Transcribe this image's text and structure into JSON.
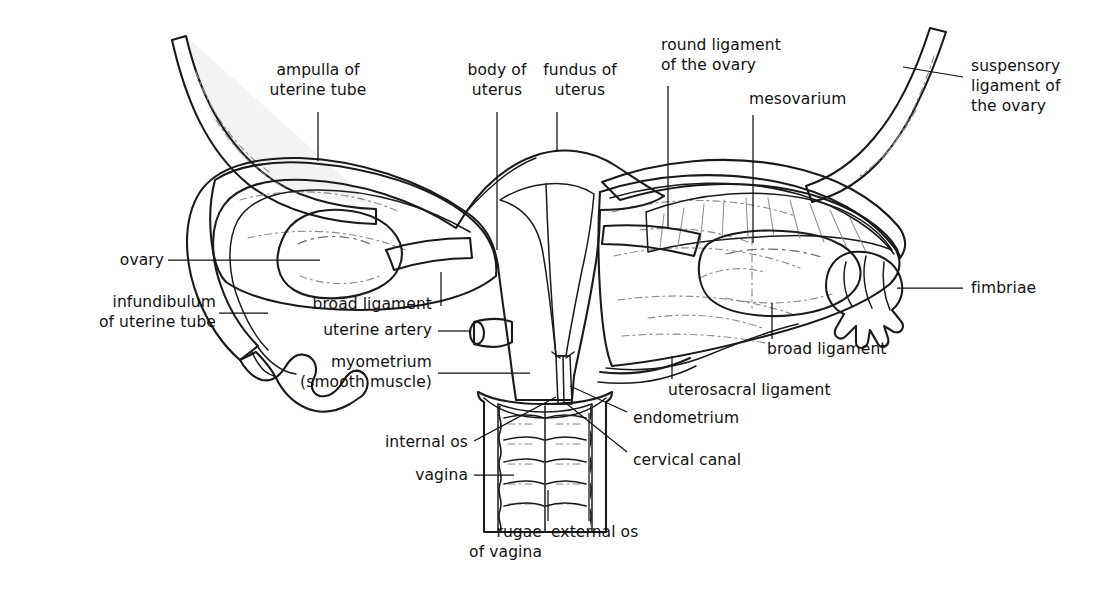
{
  "figure": {
    "background_color": "#ffffff",
    "ink_color": "#111111",
    "palette": {
      "outline": "#1a1a1a",
      "myometrium_gray": "#a9a9a9",
      "tube_wall_gray": "#b4b4b4",
      "broad_ligament_light": "#f1f1f1",
      "endometrium_light": "#e9e9e9",
      "ovary_white": "#ffffff",
      "vagina_wall_gray": "#a9a9a9",
      "vagina_lumen": "#f4f4f4",
      "leader_line": "#111111"
    }
  },
  "labels": [
    {
      "id": "ampulla-of-uterine-tube",
      "lines": [
        "ampulla of",
        "uterine tube"
      ],
      "align": "center",
      "x": 312,
      "y": 68
    },
    {
      "id": "body-of-uterus",
      "lines": [
        "body of",
        "uterus"
      ],
      "align": "center",
      "x": 441,
      "y": 68
    },
    {
      "id": "fundus-of-uterus",
      "lines": [
        "fundus of",
        "uterus"
      ],
      "align": "center",
      "x": 545,
      "y": 68
    },
    {
      "id": "round-ligament-of-the-ovary",
      "lines": [
        "round ligament",
        "of the ovary"
      ],
      "align": "left",
      "x": 661,
      "y": 43
    },
    {
      "id": "mesovarium",
      "lines": [
        "mesovarium"
      ],
      "align": "left",
      "x": 749,
      "y": 97
    },
    {
      "id": "suspensory-ligament-of-the-ovary",
      "lines": [
        "suspensory",
        "ligament of",
        "the ovary"
      ],
      "align": "left",
      "x": 971,
      "y": 62
    },
    {
      "id": "ovary",
      "lines": [
        "ovary"
      ],
      "align": "right",
      "x": 120,
      "y": 255
    },
    {
      "id": "infundibulum-of-uterine-tube",
      "lines": [
        "infundibulum",
        "of uterine tube"
      ],
      "align": "right",
      "x": 168,
      "y": 298
    },
    {
      "id": "broad-ligament-left",
      "lines": [
        "broad ligament"
      ],
      "align": "right",
      "x": 430,
      "y": 300
    },
    {
      "id": "uterine-artery",
      "lines": [
        "uterine artery"
      ],
      "align": "right",
      "x": 430,
      "y": 326
    },
    {
      "id": "myometrium-smooth-muscle",
      "lines": [
        "myometrium",
        "(smooth muscle)"
      ],
      "align": "right",
      "x": 430,
      "y": 358
    },
    {
      "id": "internal-os",
      "lines": [
        "internal os"
      ],
      "align": "right",
      "x": 466,
      "y": 437
    },
    {
      "id": "vagina",
      "lines": [
        "vagina"
      ],
      "align": "right",
      "x": 466,
      "y": 470
    },
    {
      "id": "rugae-of-vagina",
      "lines": [
        "rugae",
        "of vagina"
      ],
      "align": "right",
      "x": 540,
      "y": 527
    },
    {
      "id": "external-os",
      "lines": [
        "external os"
      ],
      "align": "left",
      "x": 551,
      "y": 527
    },
    {
      "id": "fimbriae",
      "lines": [
        "fimbriae"
      ],
      "align": "left",
      "x": 971,
      "y": 283
    },
    {
      "id": "broad-ligament-right",
      "lines": [
        "broad ligament"
      ],
      "align": "left",
      "x": 767,
      "y": 345
    },
    {
      "id": "uterosacral-ligament",
      "lines": [
        "uterosacral ligament"
      ],
      "align": "left",
      "x": 668,
      "y": 386
    },
    {
      "id": "endometrium",
      "lines": [
        "endometrium"
      ],
      "align": "left",
      "x": 633,
      "y": 414
    },
    {
      "id": "cervical-canal",
      "lines": [
        "cervical canal"
      ],
      "align": "left",
      "x": 633,
      "y": 456
    }
  ],
  "leaders": [
    {
      "id": "leader-ampulla-of-uterine-tube",
      "path": "M 318 112 L 318 161"
    },
    {
      "id": "leader-body-of-uterus",
      "path": "M 497 112 L 497 250"
    },
    {
      "id": "leader-fundus-of-uterus",
      "path": "M 557 112 L 557 152"
    },
    {
      "id": "leader-round-ligament-of-the-ovary",
      "path": "M 668 86 L 668 229"
    },
    {
      "id": "leader-mesovarium",
      "path": "M 753 115 L 753 243"
    },
    {
      "id": "leader-suspensory-ligament",
      "path": "M 963 77 L 903 67"
    },
    {
      "id": "leader-ovary",
      "path": "M 168 260 L 320 260"
    },
    {
      "id": "leader-infundibulum",
      "path": "M 219 313 L 268 313"
    },
    {
      "id": "leader-broad-ligament-left",
      "path": "M 441 306 L 441 270"
    },
    {
      "id": "leader-uterine-artery",
      "path": "M 438 331 L 472 331"
    },
    {
      "id": "leader-myometrium",
      "path": "M 438 373 L 530 373"
    },
    {
      "id": "leader-internal-os",
      "path": "M 474 441 L 556 397"
    },
    {
      "id": "leader-vagina",
      "path": "M 474 475 L 515 475"
    },
    {
      "id": "leader-rugae-of-vagina",
      "path": "M 548 521 L 548 490"
    },
    {
      "id": "leader-external-os",
      "path": "M 589 521 L 589 413"
    },
    {
      "id": "leader-fimbriae",
      "path": "M 963 288 L 899 288"
    },
    {
      "id": "leader-broad-ligament-right",
      "path": "M 772 339 L 772 303"
    },
    {
      "id": "leader-uterosacral-ligament",
      "path": "M 672 379 L 672 355"
    },
    {
      "id": "leader-endometrium",
      "path": "M 627 412 L 570 386"
    },
    {
      "id": "leader-cervical-canal",
      "path": "M 627 452 L 567 404"
    }
  ],
  "structures": [
    {
      "id": "left-uterine-tube-proximal",
      "name": "left uterine tube (isthmus/ampulla)"
    },
    {
      "id": "left-uterine-tube-suspensory-band",
      "name": "left suspensory band"
    },
    {
      "id": "left-ovary",
      "name": "left ovary"
    },
    {
      "id": "left-infundibulum",
      "name": "left infundibulum with fimbriae"
    },
    {
      "id": "left-broad-ligament",
      "name": "left broad ligament"
    },
    {
      "id": "uterus-body",
      "name": "uterine body (myometrium)"
    },
    {
      "id": "uterine-cavity",
      "name": "uterine cavity / endometrium"
    },
    {
      "id": "cervical-canal-structure",
      "name": "cervical canal"
    },
    {
      "id": "vagina-structure",
      "name": "vagina with rugae"
    },
    {
      "id": "uterine-artery-stub",
      "name": "uterine artery cut stump"
    },
    {
      "id": "right-broad-ligament",
      "name": "right broad ligament"
    },
    {
      "id": "right-ovary",
      "name": "right ovary"
    },
    {
      "id": "right-mesovarium",
      "name": "right mesovarium"
    },
    {
      "id": "right-uterine-tube",
      "name": "right uterine tube"
    },
    {
      "id": "right-fimbriae",
      "name": "right fimbriae"
    },
    {
      "id": "right-suspensory-ligament",
      "name": "right suspensory ligament of the ovary"
    },
    {
      "id": "round-ligament-structure",
      "name": "round ligament of the ovary"
    },
    {
      "id": "uterosacral-ligament-structure",
      "name": "uterosacral ligament"
    }
  ]
}
